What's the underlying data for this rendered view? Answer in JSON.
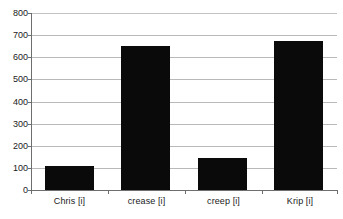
{
  "chart_data": {
    "type": "bar",
    "title": "",
    "subtitle": "",
    "xlabel": "",
    "ylabel": "",
    "categories": [
      "Chris [i]",
      "crease [i]",
      "creep [i]",
      "Krip [i]"
    ],
    "values": [
      110,
      650,
      145,
      675
    ],
    "series": [
      {
        "name": "",
        "values": [
          110,
          650,
          145,
          675
        ]
      }
    ],
    "ylim": [
      0,
      800
    ],
    "yticks": [
      0,
      100,
      200,
      300,
      400,
      500,
      600,
      700,
      800
    ],
    "ytick_labels": [
      "0",
      "100",
      "200",
      "300",
      "400",
      "500",
      "600",
      "700",
      "800"
    ],
    "grid": true,
    "grid_axis": "y",
    "legend": false,
    "legend_position": "none",
    "bar_color": "#0a0a0a",
    "grid_color": "#b9b9b9",
    "axis_color": "#6e6e6e",
    "background_color": "#ffffff",
    "text_color": "#1a1a1a",
    "annotations": []
  }
}
